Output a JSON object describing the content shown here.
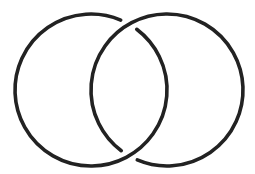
{
  "diagram": {
    "type": "interlinked-rings",
    "background": "#ffffff",
    "stroke_color": "#222222",
    "stroke_width": 3.6,
    "rings": [
      {
        "name": "left-ring",
        "cx": 91,
        "cy": 90,
        "r": 76,
        "gap_at": "top-intersection",
        "gap_start_deg": -67,
        "gap_end_deg": -53
      },
      {
        "name": "right-ring",
        "cx": 167,
        "cy": 90,
        "r": 76,
        "gap_at": "bottom-intersection",
        "gap_start_deg": 113,
        "gap_end_deg": 127
      }
    ],
    "intersections": [
      {
        "x": 129,
        "y": 24,
        "over": "right-ring",
        "under": "left-ring"
      },
      {
        "x": 129,
        "y": 156,
        "over": "left-ring",
        "under": "right-ring"
      }
    ]
  }
}
